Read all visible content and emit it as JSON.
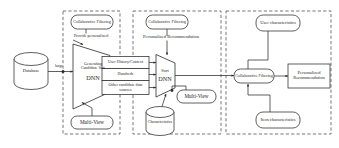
{
  "diagram": {
    "type": "flow-diagram",
    "stroke_color": "#2b2b2b",
    "dash_color": "#3a3a3a",
    "fill_color": "#ffffff",
    "panels": [
      {
        "id": "panel-candidate-generation",
        "label": ""
      },
      {
        "id": "panel-ranking",
        "label": ""
      },
      {
        "id": "panel-recommendation",
        "label": ""
      }
    ],
    "nodes": {
      "database": {
        "label": "Database",
        "shape": "cylinder"
      },
      "cf_left": {
        "label": "Collaborative Filtering",
        "shape": "rounded-rect"
      },
      "provide_personalized": {
        "label": "Provide personalized",
        "shape": "text"
      },
      "candidate_dnn": {
        "label": "Generating Candidate Sets",
        "sublabel": "DNN",
        "shape": "trapezoid"
      },
      "multiview_left": {
        "label": "Multi-View",
        "shape": "rounded-rect"
      },
      "user_history": {
        "label": "User History/Context",
        "shape": "rect"
      },
      "hundreds": {
        "label": "Hundreds",
        "shape": "rect"
      },
      "other_sources": {
        "label": "Other candidate data sources",
        "shape": "rect"
      },
      "cf_mid": {
        "label": "Collaborative Filtering",
        "shape": "rounded-rect"
      },
      "personalized_recommendation_mid": {
        "label": "Personalized Recommendation",
        "shape": "text"
      },
      "sort_dnn": {
        "label": "Sort",
        "sublabel": "DNN",
        "shape": "trapezoid"
      },
      "multiview_mid": {
        "label": "Multi-View",
        "shape": "rounded-rect"
      },
      "characteristics": {
        "label": "Characteristics",
        "shape": "cylinder"
      },
      "user_characteristics": {
        "label": "User characteristics",
        "shape": "rounded-rect"
      },
      "cf_right": {
        "label": "Collaborative Filtering",
        "shape": "rounded-rect"
      },
      "personalized_recommendation_right": {
        "label": "Personalized Recommendation",
        "shape": "rect"
      },
      "item_characteristics": {
        "label": "Item characteristics",
        "shape": "rounded-rect"
      }
    },
    "edges": {
      "large": {
        "label": "large"
      }
    }
  }
}
